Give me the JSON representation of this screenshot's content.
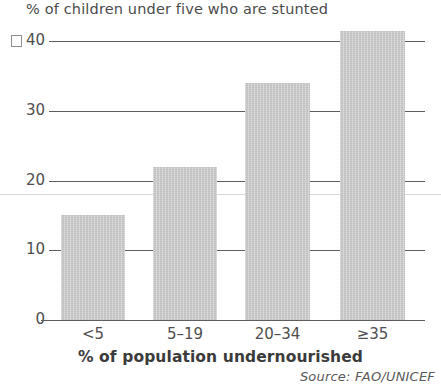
{
  "chart_data": {
    "type": "bar",
    "title": "% of children under five who are stunted",
    "xlabel": "% of population undernourished",
    "ylabel": "",
    "categories": [
      "<5",
      "5–19",
      "20–34",
      "≥35"
    ],
    "values": [
      15,
      22,
      34,
      41.5
    ],
    "ylim": [
      0,
      40
    ],
    "yticks": [
      0,
      10,
      20,
      30,
      40
    ],
    "ytick_labels": [
      "0",
      "10",
      "20",
      "30",
      "40"
    ],
    "grid": true,
    "legend": false,
    "bar_color": "#c8c8c8",
    "axis_color": "#5e5e5e",
    "text_color": "#4e4e4e",
    "source": "Source: FAO/UNICEF"
  }
}
